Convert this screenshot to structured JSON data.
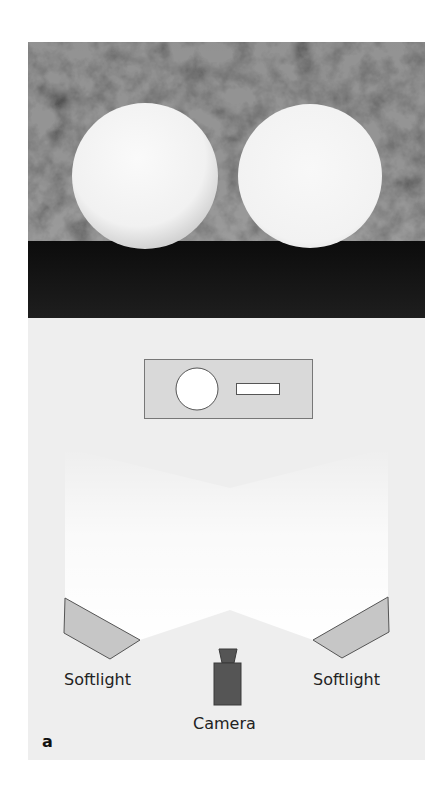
{
  "figure": {
    "panel_label": "a",
    "photo": {
      "description": "Two white spheres on a dark floor in front of a mottled gray background",
      "spheres": [
        {
          "name": "left-sphere",
          "cx": 117,
          "cy": 134,
          "r": 73
        },
        {
          "name": "right-sphere",
          "cx": 282,
          "cy": 134,
          "r": 72
        }
      ],
      "colors": {
        "background": "#5a5a5a",
        "floor": "#141414",
        "sphere": "#f4f4f4"
      }
    },
    "diagram": {
      "scene_box": {
        "fill": "#d9d9d9",
        "stroke": "#777777"
      },
      "labels": {
        "left_light": "Softlight",
        "right_light": "Softlight",
        "camera": "Camera"
      },
      "colors": {
        "panel": "#eeeeee",
        "softlight": "#c6c6c6",
        "camera": "#555555",
        "glow": "#ffffff"
      }
    }
  }
}
